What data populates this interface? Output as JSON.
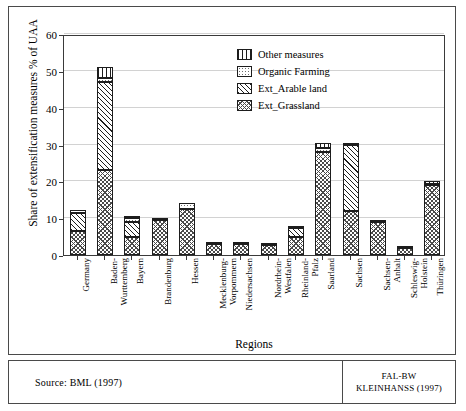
{
  "chart_data": {
    "type": "bar",
    "stacked": true,
    "title": "",
    "xlabel": "Regions",
    "ylabel": "Share of extensification measures % of UAA",
    "ylim": [
      0,
      60
    ],
    "yticks": [
      0,
      10,
      20,
      30,
      40,
      50,
      60
    ],
    "grid": true,
    "legend_position": "top-right",
    "categories": [
      "Germany",
      "Baden-Wuerttemberg",
      "Bayern",
      "Brandenburg",
      "Hessen",
      "Mecklenburg-Vorpommern",
      "Niedersachsen",
      "Nordrhein-Westfalen",
      "Rheinland-Pfalz",
      "Saarland",
      "Sachsen",
      "Sachsen-Anhalt",
      "Schleswig-Holstein",
      "Thueringen"
    ],
    "category_labels": [
      {
        "line1": "Germany",
        "line2": ""
      },
      {
        "line1": "Baden-",
        "line2": "Wurttemberg"
      },
      {
        "line1": "Bayern",
        "line2": ""
      },
      {
        "line1": "Brandenburg",
        "line2": ""
      },
      {
        "line1": "Hessen",
        "line2": ""
      },
      {
        "line1": "Mecklenburg-",
        "line2": "Vorpommern"
      },
      {
        "line1": "Niedersachsen",
        "line2": ""
      },
      {
        "line1": "Nordrhein-",
        "line2": "Westfalen"
      },
      {
        "line1": "Rheinland-",
        "line2": "Pfalz"
      },
      {
        "line1": "Saarland",
        "line2": ""
      },
      {
        "line1": "Sachsen",
        "line2": ""
      },
      {
        "line1": "Sachsen-",
        "line2": "Anhalt"
      },
      {
        "line1": "Schleswig-",
        "line2": "Holstein"
      },
      {
        "line1": "Thüringen",
        "line2": ""
      }
    ],
    "series": [
      {
        "name": "Ext_Grassland",
        "pattern": "cross-hatch",
        "values": [
          6.5,
          23.0,
          5.0,
          9.5,
          12.5,
          3.0,
          3.0,
          2.6,
          5.0,
          28.0,
          12.0,
          9.0,
          1.8,
          19.0
        ]
      },
      {
        "name": "Ext_Arable land",
        "pattern": "diagonal-hatch",
        "values": [
          4.8,
          24.0,
          4.0,
          0.0,
          0.0,
          0.0,
          0.0,
          0.0,
          2.3,
          0.0,
          18.0,
          0.0,
          0.0,
          0.0
        ]
      },
      {
        "name": "Organic Farming",
        "pattern": "dotted",
        "values": [
          0.8,
          1.0,
          1.0,
          0.3,
          1.6,
          0.3,
          0.5,
          0.5,
          0.5,
          1.0,
          0.5,
          0.6,
          0.3,
          0.4
        ]
      },
      {
        "name": "Other measures",
        "pattern": "vertical-lines",
        "values": [
          0.0,
          3.0,
          0.6,
          0.0,
          0.0,
          0.0,
          0.0,
          0.0,
          0.0,
          1.5,
          0.0,
          0.0,
          0.0,
          0.8
        ]
      }
    ],
    "totals": [
      12.1,
      51.0,
      10.6,
      9.8,
      14.1,
      3.3,
      3.5,
      3.1,
      7.8,
      30.5,
      30.5,
      9.6,
      2.1,
      20.2
    ]
  },
  "legend": {
    "items": [
      {
        "label": "Other measures",
        "pattern": "vertical-lines"
      },
      {
        "label": "Organic Farming",
        "pattern": "dotted"
      },
      {
        "label": "Ext_Arable land",
        "pattern": "diagonal-hatch"
      },
      {
        "label": "Ext_Grassland",
        "pattern": "cross-hatch"
      }
    ]
  },
  "footer": {
    "source": "Source: BML (1997)",
    "credit_line1": "FAL-BW",
    "credit_line2": "KLEINHANSS (1997)"
  }
}
